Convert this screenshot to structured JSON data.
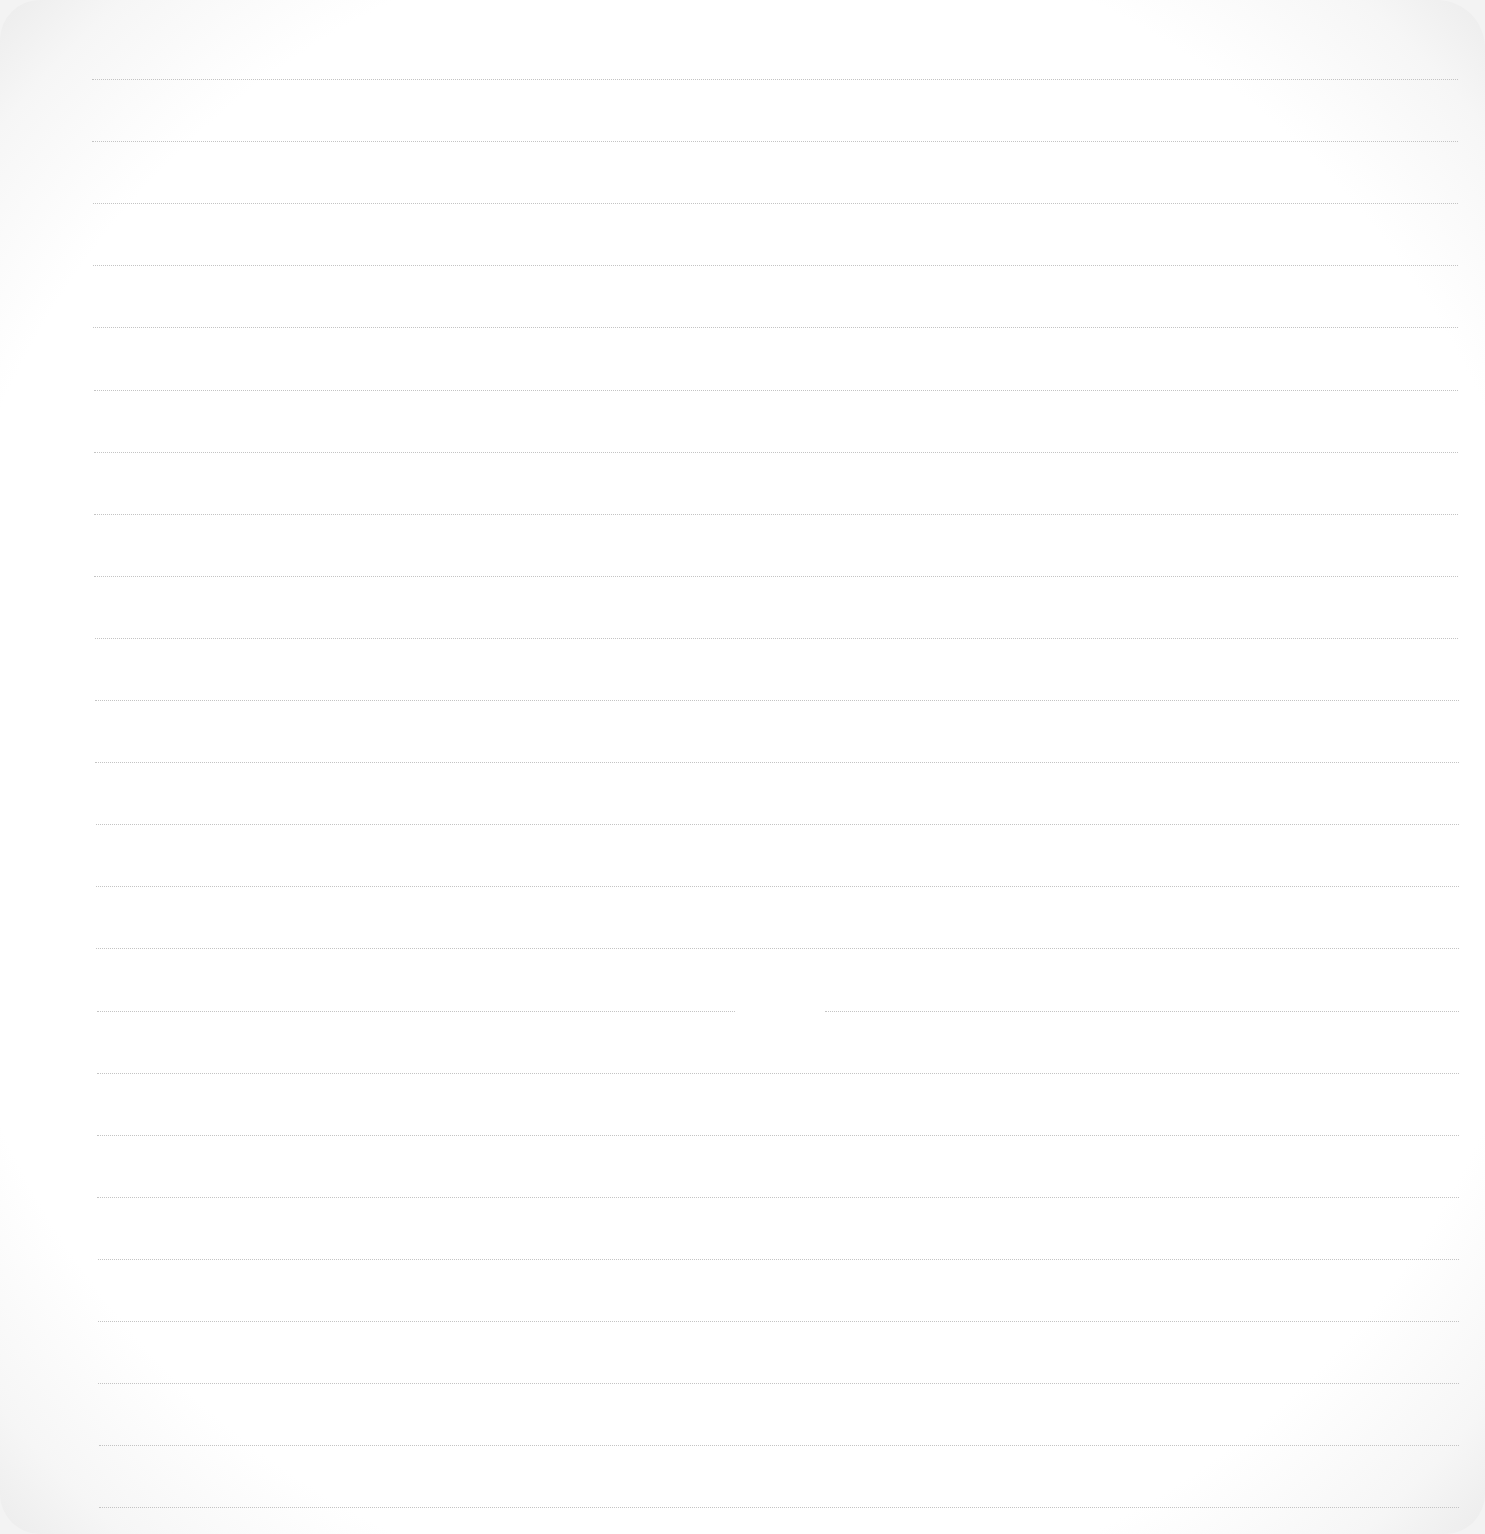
{
  "page": {
    "type": "ruled-paper",
    "background_color": "#ffffff",
    "line_color": "#c4c4c4",
    "line_style": "dotted",
    "line_count": 24,
    "line_spacing_px": 62,
    "first_line_y": 79,
    "line_x_start": 92,
    "line_x_end": 1458,
    "gap": {
      "line_index": 15,
      "x_start": 735,
      "x_end": 825
    },
    "text": []
  }
}
